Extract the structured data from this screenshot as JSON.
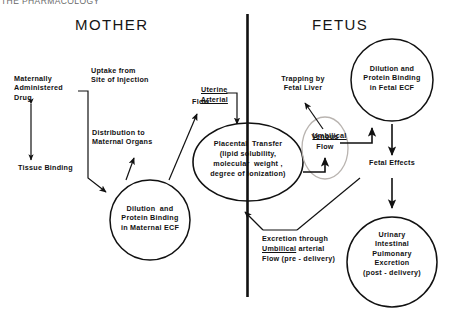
{
  "figure": {
    "clipped_header": "THE PHARMACOLOGY",
    "mother_title": "MOTHER",
    "fetus_title": "FETUS",
    "divider": "vertical-divider"
  },
  "mother": {
    "maternally_administered_drug": "Maternally\nAdministered\nDrug",
    "tissue_binding": "Tissue Binding",
    "uptake_from_site_of_injection": "Uptake from\nSite of Injection",
    "distribution_to_maternal_organs": "Distribution to\nMaternal Organs",
    "maternal_ecf": "Dilution  and\nProtein Binding\nin Maternal ECF",
    "uterine_label": "Uterine",
    "arterial_label": "Arterial",
    "flow_label": "Flow"
  },
  "placenta": {
    "line1": "Placental  Transfer",
    "line2": "(lipid solubility,",
    "line3": "molecular  weight ,",
    "line4": "degree of ionization)"
  },
  "fetus": {
    "trapping_by_fetal_liver": "Trapping by\nFetal Liver",
    "fetal_ecf": "Dilution and\nProtein Binding\nin Fetal ECF",
    "umbilical_label": "Umbilical",
    "venous_label": "Venous",
    "flow_label": "Flow",
    "fetal_effects": "Fetal Effects",
    "post_delivery_excretion": "Urinary\nIntestinal\nPulmonary\nExcretion\n(post - delivery)"
  },
  "excretion_box": {
    "line1": "Excretion through",
    "line2_underlined": "Umbilical",
    "line2_rest": " arterial",
    "line3": "Flow (pre - delivery)"
  },
  "colors": {
    "ink": "#111111",
    "faint_oval": "#b9b4b0",
    "background": "#ffffff"
  }
}
